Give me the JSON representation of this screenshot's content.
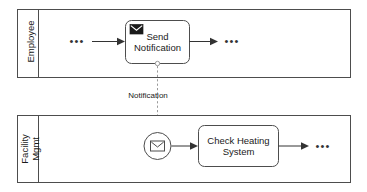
{
  "diagram": {
    "type": "bpmn-collaboration",
    "title": "",
    "background_color": "#ffffff",
    "stroke_color": "#4d4d4d",
    "flow_color": "#333333",
    "message_flow_color": "#9a9a9a"
  },
  "pools": [
    {
      "id": "employee",
      "lane_label": "Employee",
      "lane_label_lines": [
        "Employee"
      ]
    },
    {
      "id": "facility-mgmt",
      "lane_label": "Facility Mgmt",
      "lane_label_lines": [
        "Facility",
        "Mgmt"
      ]
    }
  ],
  "elements": {
    "send_notification_task": {
      "label": "Send\nNotification",
      "label_line_1": "Send",
      "label_line_2": "Notification",
      "marker": "send-message-envelope-icon",
      "marker_style": "filled"
    },
    "message_start_event": {
      "label": "",
      "marker": "receive-message-envelope-icon",
      "marker_style": "outline",
      "event_type": "message-start-event"
    },
    "check_heating_task": {
      "label": "Check Heating\nSystem",
      "label_line_1": "Check Heating",
      "label_line_2": "System",
      "marker": "none"
    }
  },
  "flows": {
    "message_flow": {
      "label": "Notification",
      "style": "dashed",
      "source": "send_notification_task",
      "target": "message_start_event"
    },
    "sequence_flows": [
      {
        "id": "employee-in",
        "label": ""
      },
      {
        "id": "employee-out",
        "label": ""
      },
      {
        "id": "facility-event-to-task",
        "label": ""
      },
      {
        "id": "facility-out",
        "label": ""
      }
    ]
  },
  "continuation_markers": {
    "employee_left": "•••",
    "employee_right": "•••",
    "facility_right": "•••"
  }
}
